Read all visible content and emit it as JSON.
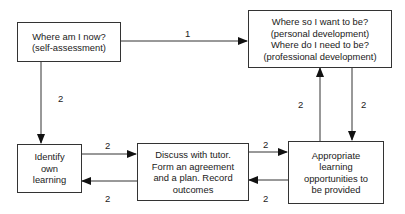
{
  "diagram": {
    "nodes": [
      {
        "id": "now",
        "lines": [
          "Where am I now?",
          "(self-assessment)"
        ]
      },
      {
        "id": "want",
        "lines": [
          "Where so I want to be?",
          "(personal development)",
          "Where do I need to be?",
          "(professional development)"
        ]
      },
      {
        "id": "identify",
        "lines": [
          "Identify",
          "own",
          "learning"
        ]
      },
      {
        "id": "discuss",
        "lines": [
          "Discuss with tutor.",
          "Form an agreement",
          "and a plan.  Record",
          "outcomes"
        ]
      },
      {
        "id": "opportunities",
        "lines": [
          "Appropriate",
          "learning",
          "opportunities to",
          "be provided"
        ]
      }
    ],
    "edges": [
      {
        "from": "now",
        "to": "want",
        "label": "1"
      },
      {
        "from": "now",
        "to": "identify",
        "label": "2"
      },
      {
        "from": "identify",
        "to": "discuss",
        "label": "2"
      },
      {
        "from": "discuss",
        "to": "identify",
        "label": "2"
      },
      {
        "from": "discuss",
        "to": "opportunities",
        "label": "2"
      },
      {
        "from": "opportunities",
        "to": "discuss",
        "label": "2"
      },
      {
        "from": "opportunities",
        "to": "want",
        "label": "2"
      },
      {
        "from": "want",
        "to": "opportunities",
        "label": "2"
      }
    ]
  }
}
